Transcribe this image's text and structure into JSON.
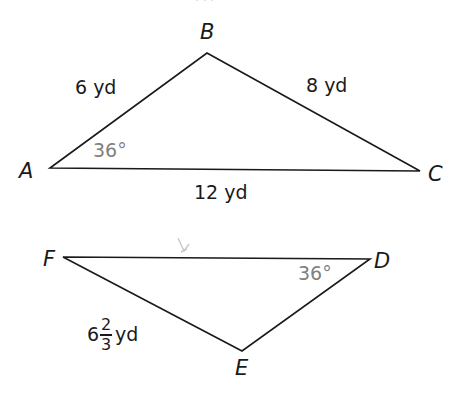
{
  "header": {
    "cut_off_text": "· · ·"
  },
  "colors": {
    "line": "#1a1a1a",
    "angle_label": "#808080",
    "cursor_mark": "#c8c8c8"
  },
  "triangles": [
    {
      "name": "ABC",
      "vertices": {
        "A": {
          "label": "A",
          "x": 50,
          "y": 168
        },
        "B": {
          "label": "B",
          "x": 207,
          "y": 53
        },
        "C": {
          "label": "C",
          "x": 420,
          "y": 171
        }
      },
      "sides": {
        "AB": "6 yd",
        "BC": "8 yd",
        "AC": "12 yd"
      },
      "angle": {
        "vertex": "A",
        "label": "36°"
      }
    },
    {
      "name": "FDE",
      "vertices": {
        "F": {
          "label": "F",
          "x": 63,
          "y": 257
        },
        "D": {
          "label": "D",
          "x": 370,
          "y": 259
        },
        "E": {
          "label": "E",
          "x": 242,
          "y": 351
        }
      },
      "sides": {
        "FE": {
          "whole": "6",
          "numerator": "2",
          "denominator": "3",
          "unit": "yd"
        }
      },
      "angle": {
        "vertex": "D",
        "label": "36°"
      }
    }
  ]
}
